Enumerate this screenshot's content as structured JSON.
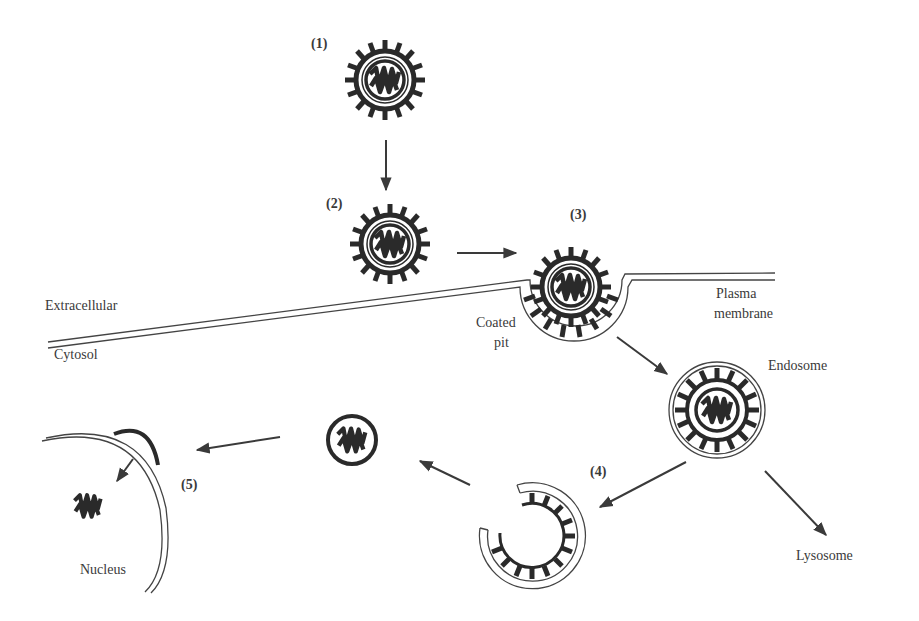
{
  "diagram": {
    "type": "process-flow",
    "steps": [
      {
        "id": "1",
        "label": "(1)"
      },
      {
        "id": "2",
        "label": "(2)"
      },
      {
        "id": "3",
        "label": "(3)"
      },
      {
        "id": "4",
        "label": "(4)"
      },
      {
        "id": "5",
        "label": "(5)"
      }
    ],
    "labels": {
      "extracellular": "Extracellular",
      "cytosol": "Cytosol",
      "coated_pit_line1": "Coated",
      "coated_pit_line2": "pit",
      "plasma_membrane_line1": "Plasma",
      "plasma_membrane_line2": "membrane",
      "endosome": "Endosome",
      "lysosome": "Lysosome",
      "nucleus": "Nucleus"
    },
    "arrows": [
      {
        "from": "step-1",
        "to": "step-2"
      },
      {
        "from": "step-2",
        "to": "step-3"
      },
      {
        "from": "coated-pit",
        "to": "endosome"
      },
      {
        "from": "endosome",
        "to": "step-4"
      },
      {
        "from": "endosome",
        "to": "lysosome"
      },
      {
        "from": "step-4",
        "to": "nucleocapsid"
      },
      {
        "from": "nucleocapsid",
        "to": "step-5"
      }
    ],
    "colors": {
      "ink": "#2e2e2e",
      "background": "#ffffff"
    }
  }
}
